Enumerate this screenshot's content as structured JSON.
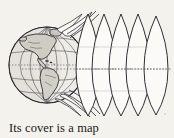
{
  "figure": {
    "name": "globe-peeling-map-gores",
    "caption": "Its cover is a map",
    "background_color": "#f4f2ec",
    "ink_color": "#2b2b30",
    "line_color": "#55555c",
    "land_fill": "#d8d6cf",
    "ocean_fill": "#eceae4",
    "gore_fill": "#fbfaf7",
    "globe": {
      "label": "globe",
      "center_x": 47,
      "center_y": 65,
      "radius": 38,
      "continents_shown": "Americas",
      "graticule": "latitude and longitude grid",
      "equator_style": "dotted"
    },
    "gores": {
      "label": "map-gores",
      "count": 7,
      "description": "lens shaped map strips peeling off the globe",
      "equator_y": 69,
      "tip_top_y": 14,
      "tip_bottom_y": 116,
      "edge_x_positions": [
        88,
        103,
        119,
        136,
        153,
        169
      ]
    },
    "equator_line": {
      "label": "equator",
      "style": "dotted",
      "y": 69,
      "x_start": 22,
      "x_end": 172
    }
  }
}
